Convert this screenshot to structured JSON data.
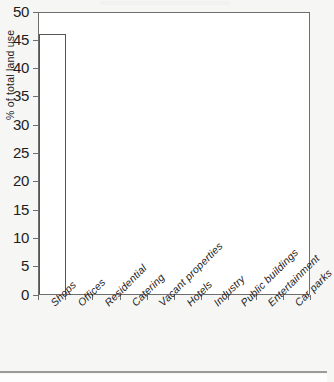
{
  "chart_data": {
    "type": "bar",
    "title": "",
    "subtitle": "",
    "xlabel": "",
    "ylabel": "% of total land use",
    "categories": [
      "Shops",
      "Offices",
      "Residential",
      "Catering",
      "Vacant properties",
      "Hotels",
      "Industry",
      "Public buildings",
      "Entertainment",
      "Car parks"
    ],
    "values": [
      46,
      0,
      0,
      0,
      0,
      0,
      0,
      0,
      0,
      0
    ],
    "ylim": [
      0,
      50
    ],
    "ytick_labels": [
      "0",
      "5",
      "10",
      "15",
      "20",
      "25",
      "30",
      "35",
      "40",
      "45",
      "50"
    ],
    "ytick_values": [
      0,
      5,
      10,
      15,
      20,
      25,
      30,
      35,
      40,
      45,
      50
    ],
    "grid": false,
    "legend": false,
    "legend_position": "none",
    "bar_fill_color": "#ffffff",
    "bar_edge_color": "#555555",
    "axis_color": "#6e6e6e",
    "background_color": "#f6f6f4",
    "plot_background_color": "#ffffff",
    "text_color": "#1d1d1d"
  }
}
